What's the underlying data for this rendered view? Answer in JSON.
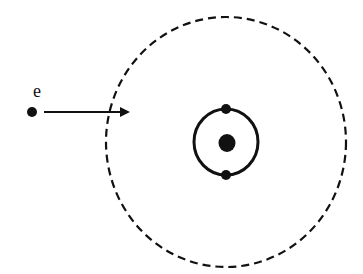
{
  "diagram": {
    "type": "atomic-collision",
    "incoming_particle": {
      "label": "e",
      "position": [
        32,
        112
      ],
      "arrow_end": [
        128,
        112
      ]
    },
    "outer_boundary": {
      "style": "dashed",
      "center": [
        226,
        142
      ],
      "rx": 120,
      "ry": 125
    },
    "inner_orbit": {
      "center": [
        226,
        142
      ],
      "rx": 32,
      "ry": 33,
      "electrons": [
        [
          226,
          109
        ],
        [
          226,
          175
        ]
      ]
    },
    "nucleus": {
      "center": [
        227,
        143
      ],
      "r": 8
    },
    "colors": {
      "stroke": "#111111",
      "background": "#ffffff"
    }
  }
}
